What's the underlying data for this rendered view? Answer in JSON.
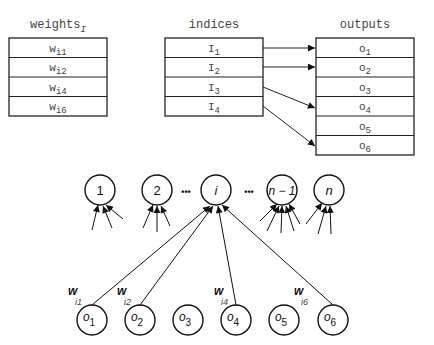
{
  "tables": {
    "weights": {
      "title": "weights",
      "title_sub": "I",
      "rows": [
        {
          "base": "w",
          "sub": "i1"
        },
        {
          "base": "w",
          "sub": "i2"
        },
        {
          "base": "w",
          "sub": "i4"
        },
        {
          "base": "w",
          "sub": "i6"
        }
      ]
    },
    "indices": {
      "title": "indices",
      "rows": [
        {
          "base": "I",
          "sub": "1"
        },
        {
          "base": "I",
          "sub": "2"
        },
        {
          "base": "I",
          "sub": "3"
        },
        {
          "base": "I",
          "sub": "4"
        }
      ]
    },
    "outputs": {
      "title": "outputs",
      "rows": [
        {
          "base": "o",
          "sub": "1"
        },
        {
          "base": "o",
          "sub": "2"
        },
        {
          "base": "o",
          "sub": "3"
        },
        {
          "base": "o",
          "sub": "4"
        },
        {
          "base": "o",
          "sub": "5"
        },
        {
          "base": "o",
          "sub": "6"
        }
      ]
    }
  },
  "mapping": [
    {
      "from": "I1",
      "to": "o1"
    },
    {
      "from": "I2",
      "to": "o2"
    },
    {
      "from": "I3",
      "to": "o4"
    },
    {
      "from": "I4",
      "to": "o6"
    }
  ],
  "graph": {
    "top_nodes": [
      {
        "label": "1"
      },
      {
        "label": "2"
      },
      {
        "label": "i"
      },
      {
        "label": "n − 1"
      },
      {
        "label": "n"
      }
    ],
    "ellipsis": "•••",
    "bottom_nodes": [
      {
        "base": "o",
        "sub": "1"
      },
      {
        "base": "o",
        "sub": "2"
      },
      {
        "base": "o",
        "sub": "3"
      },
      {
        "base": "o",
        "sub": "4"
      },
      {
        "base": "o",
        "sub": "5"
      },
      {
        "base": "o",
        "sub": "6"
      }
    ],
    "edge_labels": [
      {
        "base": "w",
        "sub": "i1"
      },
      {
        "base": "w",
        "sub": "i2"
      },
      {
        "base": "w",
        "sub": "i4"
      },
      {
        "base": "w",
        "sub": "i6"
      }
    ]
  }
}
